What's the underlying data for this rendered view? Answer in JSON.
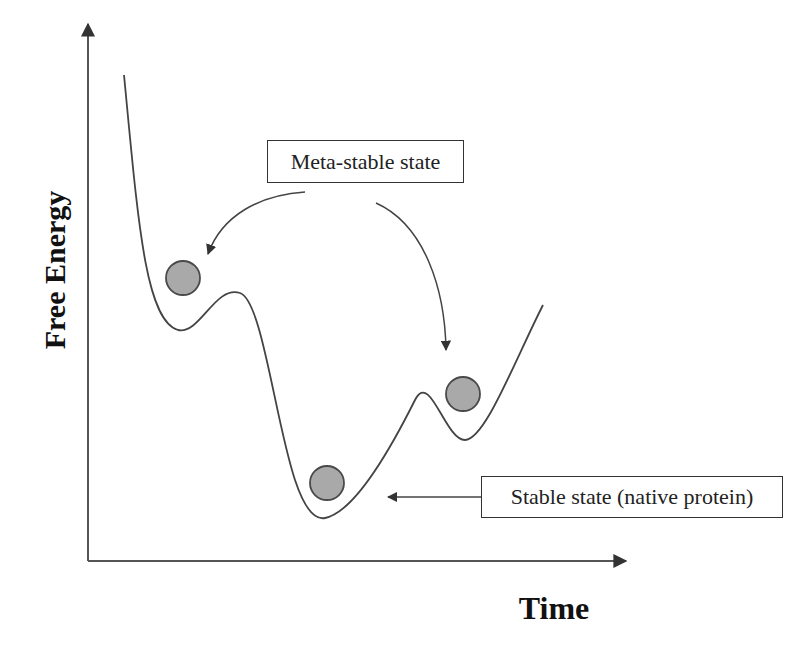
{
  "figure": {
    "type": "energy-landscape",
    "axes": {
      "x_label": "Time",
      "y_label": "Free Energy"
    },
    "annotations": [
      {
        "id": "meta",
        "text": "Meta-stable state",
        "points_to": [
          "left-local-minimum",
          "right-local-minimum"
        ]
      },
      {
        "id": "stable",
        "text": "Stable state (native protein)",
        "points_to": [
          "global-minimum"
        ]
      }
    ],
    "states": [
      {
        "name": "left-meta-stable-ball",
        "kind": "meta-stable"
      },
      {
        "name": "native-stable-ball",
        "kind": "stable"
      },
      {
        "name": "right-meta-stable-ball",
        "kind": "meta-stable"
      }
    ],
    "colors": {
      "line": "#444444",
      "ball_fill": "#a9a9a9",
      "ball_stroke": "#4a4a4a",
      "text": "#222222"
    }
  }
}
